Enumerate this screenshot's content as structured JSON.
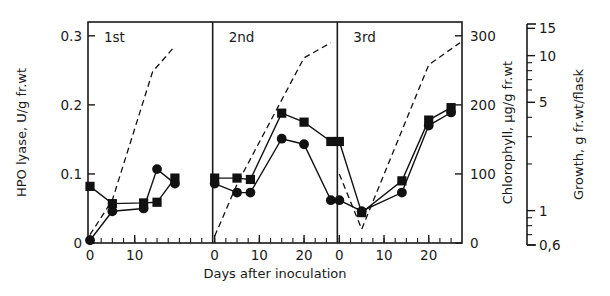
{
  "figure": {
    "panels": [
      {
        "label": "1st"
      },
      {
        "label": "2nd"
      },
      {
        "label": "3rd"
      }
    ],
    "axes": {
      "x": {
        "title": "Days after inoculation",
        "ticks": [
          "0",
          "10",
          "20"
        ],
        "ticks_panel1": [
          "0",
          "10"
        ],
        "range": [
          0,
          27
        ]
      },
      "y_left": {
        "title": "HPO lyase, U/g fr.wt",
        "ticks": [
          "0",
          "0.1",
          "0.2",
          "0.3"
        ],
        "range": [
          0,
          0.32
        ]
      },
      "y_right_1": {
        "title": "Chlorophyll, μg/g fr.wt",
        "ticks": [
          "0",
          "100",
          "200",
          "300"
        ],
        "range": [
          0,
          320
        ]
      },
      "y_right_2": {
        "title": "Growth, g fr.wt/flask",
        "ticks": [
          "0,6",
          "1",
          "5",
          "10",
          "15"
        ],
        "scale": "log",
        "range": [
          0.6,
          16
        ]
      }
    }
  },
  "chart_data": {
    "type": "line",
    "title": "",
    "xlabel": "Days after inoculation",
    "ylabel": "HPO lyase, U/g fr.wt",
    "ylabel_right_1": "Chlorophyll, μg/g fr.wt",
    "ylabel_right_2": "Growth, g fr.wt/flask",
    "xlim": [
      0,
      27
    ],
    "ylim": [
      0,
      0.32
    ],
    "ylim_right_1": [
      0,
      320
    ],
    "ylim_right_2": [
      0.6,
      16
    ],
    "y_right_2_scale": "log",
    "grid": false,
    "legend": "none",
    "panels": [
      {
        "name": "1st",
        "xlim": [
          0,
          19
        ],
        "series": [
          {
            "name": "HPO lyase",
            "marker": "square",
            "linestyle": "solid",
            "x": [
              0,
              5,
              12,
              15,
              19
            ],
            "y": [
              0.082,
              0.057,
              0.058,
              0.059,
              0.094
            ]
          },
          {
            "name": "Chlorophyll",
            "marker": "circle",
            "linestyle": "solid",
            "x": [
              0,
              5,
              12,
              15,
              19
            ],
            "y": [
              0.004,
              0.046,
              0.05,
              0.107,
              0.086
            ]
          },
          {
            "name": "Growth",
            "marker": "none",
            "linestyle": "dashed",
            "x": [
              0,
              5,
              14,
              19
            ],
            "y": [
              0.012,
              0.062,
              0.248,
              0.285
            ]
          }
        ]
      },
      {
        "name": "2nd",
        "xlim": [
          0,
          26
        ],
        "series": [
          {
            "name": "HPO lyase",
            "marker": "square",
            "linestyle": "solid",
            "x": [
              0,
              5,
              8,
              15,
              20,
              26
            ],
            "y": [
              0.094,
              0.094,
              0.092,
              0.188,
              0.175,
              0.147
            ]
          },
          {
            "name": "Chlorophyll",
            "marker": "circle",
            "linestyle": "solid",
            "x": [
              0,
              5,
              8,
              15,
              20,
              26
            ],
            "y": [
              0.086,
              0.073,
              0.073,
              0.151,
              0.143,
              0.062
            ]
          },
          {
            "name": "Growth",
            "marker": "none",
            "linestyle": "dashed",
            "x": [
              0,
              5,
              20,
              26
            ],
            "y": [
              0.01,
              0.085,
              0.268,
              0.29
            ]
          }
        ]
      },
      {
        "name": "3rd",
        "xlim": [
          0,
          27
        ],
        "series": [
          {
            "name": "HPO lyase",
            "marker": "square",
            "linestyle": "solid",
            "x": [
              0,
              5,
              14,
              20,
              25
            ],
            "y": [
              0.147,
              0.044,
              0.09,
              0.178,
              0.196
            ]
          },
          {
            "name": "Chlorophyll",
            "marker": "circle",
            "linestyle": "solid",
            "x": [
              0,
              5,
              14,
              20,
              25
            ],
            "y": [
              0.062,
              0.046,
              0.073,
              0.17,
              0.189
            ]
          },
          {
            "name": "Growth",
            "marker": "none",
            "linestyle": "dashed",
            "x": [
              0,
              5,
              20,
              27
            ],
            "y": [
              0.1,
              0.02,
              0.258,
              0.29
            ]
          }
        ]
      }
    ]
  }
}
